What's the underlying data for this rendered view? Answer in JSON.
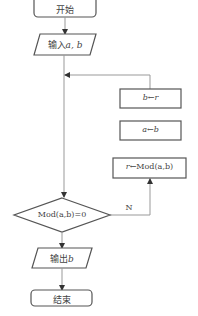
{
  "flowchart": {
    "start": {
      "label": "开始"
    },
    "input": {
      "prefix": "输入",
      "vars": "a, b"
    },
    "assign_b": {
      "target": "b",
      "arrow": "←",
      "source": "r"
    },
    "assign_a": {
      "target": "a",
      "arrow": "←",
      "source": "b"
    },
    "assign_r": {
      "target": "r",
      "arrow": "←",
      "expr": "Mod(a,b)"
    },
    "decision": {
      "condition": "Mod(a,b)=0",
      "no_label": "N"
    },
    "output": {
      "prefix": "输出",
      "var": "b"
    },
    "end": {
      "label": "结束"
    }
  },
  "colors": {
    "stroke": "#444444",
    "line": "#9a9a9a",
    "background": "#ffffff"
  }
}
